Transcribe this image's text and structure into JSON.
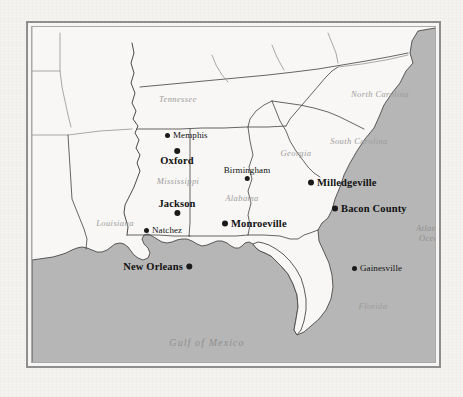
{
  "map": {
    "title": "Map of the American South",
    "colors": {
      "paper": "#f4f3f0",
      "land": "#f8f7f5",
      "ocean": "#b6b6b6",
      "border_line": "#4a4a4a",
      "state_line": "#555555",
      "frame_outer": "#8e8e8e",
      "frame_inner": "#a9a9a9",
      "city_dot": "#1a1a1a",
      "region_label": "#9c9c9c",
      "city_label": "#111111"
    },
    "frame": {
      "style": "double-rule",
      "x": 26,
      "y": 21,
      "width": 415,
      "height": 347
    },
    "regions": [
      {
        "name": "Tennessee",
        "x": 146,
        "y": 72,
        "size": "normal"
      },
      {
        "name": "North Carolina",
        "x": 348,
        "y": 67,
        "size": "normal"
      },
      {
        "name": "South Carolina",
        "x": 327,
        "y": 114,
        "size": "normal"
      },
      {
        "name": "Georgia",
        "x": 264,
        "y": 126,
        "size": "normal"
      },
      {
        "name": "Mississippi",
        "x": 146,
        "y": 154,
        "size": "normal"
      },
      {
        "name": "Alabama",
        "x": 210,
        "y": 171,
        "size": "normal"
      },
      {
        "name": "Louisiana",
        "x": 83,
        "y": 196,
        "size": "normal"
      },
      {
        "name": "Florida",
        "x": 341,
        "y": 279,
        "size": "normal"
      }
    ],
    "waters": [
      {
        "name": "Gulf of Mexico",
        "x": 175,
        "y": 315,
        "size": "big",
        "lines": [
          "Gulf of Mexico"
        ]
      },
      {
        "name": "Atlantic Ocean",
        "x": 399,
        "y": 207,
        "size": "normal",
        "lines": [
          "Atlantic",
          "Ocean"
        ]
      }
    ],
    "cities": [
      {
        "name": "Memphis",
        "x": 133,
        "y": 108,
        "featured": false,
        "layout": "dot-left"
      },
      {
        "name": "Oxford",
        "x": 145,
        "y": 130,
        "featured": true,
        "layout": "dot-above"
      },
      {
        "name": "Birmingham",
        "x": 215,
        "y": 146,
        "featured": false,
        "layout": "dot-below"
      },
      {
        "name": "Milledgeville",
        "x": 276,
        "y": 155,
        "featured": true,
        "layout": "dot-left"
      },
      {
        "name": "Bacon County",
        "x": 300,
        "y": 181,
        "featured": true,
        "layout": "dot-left"
      },
      {
        "name": "Jackson",
        "x": 145,
        "y": 180,
        "featured": true,
        "layout": "dot-below"
      },
      {
        "name": "Monroeville",
        "x": 190,
        "y": 196,
        "featured": true,
        "layout": "dot-left"
      },
      {
        "name": "Natchez",
        "x": 112,
        "y": 203,
        "featured": false,
        "layout": "dot-left"
      },
      {
        "name": "Gainesville",
        "x": 320,
        "y": 241,
        "featured": false,
        "layout": "dot-left"
      },
      {
        "name": "New Orleans",
        "x": 160,
        "y": 239,
        "featured": true,
        "layout": "dot-right"
      }
    ]
  }
}
